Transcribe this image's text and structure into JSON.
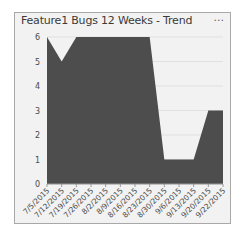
{
  "card": {
    "title": "Feature1 Bugs 12 Weeks - Trend",
    "more_label": "..."
  },
  "colors": {
    "area_fill": "#4d4d4d",
    "background": "#f2f2f2",
    "gridline": "#e0e0e0",
    "border": "#a8a8a8"
  },
  "chart_data": {
    "type": "area",
    "title": "Feature1 Bugs 12 Weeks - Trend",
    "xlabel": "",
    "ylabel": "",
    "categories": [
      "7/5/2015",
      "7/12/2015",
      "7/19/2015",
      "7/26/2015",
      "8/2/2015",
      "8/9/2015",
      "8/16/2015",
      "8/23/2015",
      "8/30/2015",
      "9/6/2015",
      "9/13/2015",
      "9/20/2015",
      "9/22/2015"
    ],
    "values": [
      6,
      5,
      6,
      6,
      6,
      6,
      6,
      6,
      1,
      1,
      1,
      3,
      3
    ],
    "yticks": [
      0,
      1,
      2,
      3,
      4,
      5,
      6
    ],
    "ylim": [
      0,
      6
    ],
    "grid": true,
    "legend": "none"
  }
}
